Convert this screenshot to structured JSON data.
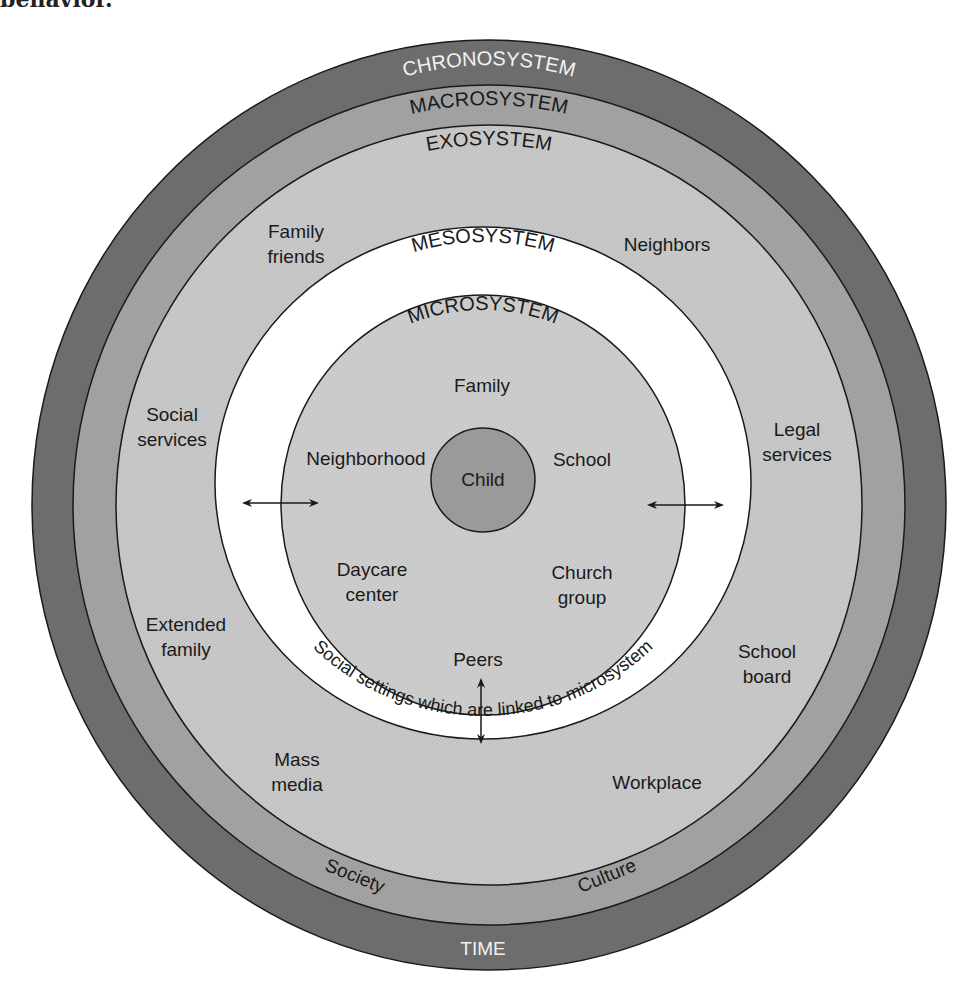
{
  "caption_fragment": "behavior.",
  "colors": {
    "chronosystem": "#6d6d6d",
    "macrosystem": "#a3a3a3",
    "exosystem": "#c8c8c8",
    "mesosystem": "#ffffff",
    "microsystem": "#cdcdcd",
    "child": "#9a9a9a",
    "outline": "#1a1a1a"
  },
  "rings": {
    "chronosystem": {
      "title": "CHRONOSYSTEM",
      "bottom_label": "TIME"
    },
    "macrosystem": {
      "title": "MACROSYSTEM",
      "labels": [
        "Society",
        "Culture"
      ]
    },
    "exosystem": {
      "title": "EXOSYSTEM",
      "items": [
        {
          "line1": "Family",
          "line2": "friends"
        },
        {
          "line1": "Neighbors",
          "line2": ""
        },
        {
          "line1": "Social",
          "line2": "services"
        },
        {
          "line1": "Legal",
          "line2": "services"
        },
        {
          "line1": "Extended",
          "line2": "family"
        },
        {
          "line1": "School",
          "line2": "board"
        },
        {
          "line1": "Mass",
          "line2": "media"
        },
        {
          "line1": "Workplace",
          "line2": ""
        }
      ]
    },
    "mesosystem": {
      "title": "MESOSYSTEM",
      "description": "Social settings which are linked to microsystem"
    },
    "microsystem": {
      "title": "MICROSYSTEM",
      "items": [
        {
          "line1": "Family",
          "line2": ""
        },
        {
          "line1": "Neighborhood",
          "line2": ""
        },
        {
          "line1": "School",
          "line2": ""
        },
        {
          "line1": "Daycare",
          "line2": "center"
        },
        {
          "line1": "Church",
          "line2": "group"
        },
        {
          "line1": "Peers",
          "line2": ""
        }
      ]
    },
    "center": {
      "label": "Child"
    }
  },
  "arrows": [
    "left-bidirectional",
    "right-bidirectional",
    "bottom-bidirectional"
  ]
}
